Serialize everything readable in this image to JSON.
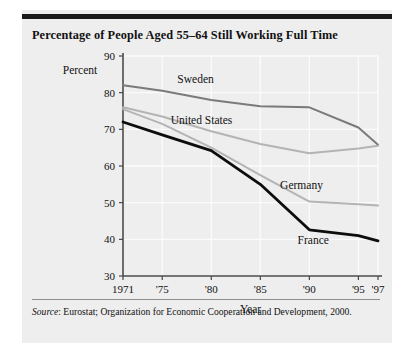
{
  "figure": {
    "title": "Percentage of People Aged 55–64 Still Working Full Time",
    "source_prefix": "Source",
    "source_text": ": Eurostat; Organization for Economic Cooperation and Development, 2000."
  },
  "chart_data": {
    "type": "line",
    "title": "Percentage of People Aged 55–64 Still Working Full Time",
    "xlabel": "Year",
    "ylabel": "Percent",
    "x": [
      1971,
      1975,
      1980,
      1985,
      1990,
      1995,
      1997
    ],
    "tick_labels": [
      "1971",
      "'75",
      "'80",
      "'85",
      "'90",
      "'95",
      "'97"
    ],
    "ylim": [
      30,
      90
    ],
    "yticks": [
      30,
      40,
      50,
      60,
      70,
      80,
      90
    ],
    "ytick_labels": [
      "30",
      "40",
      "50",
      "60",
      "70",
      "80",
      "90"
    ],
    "grid": true,
    "legend": "inline-labels",
    "series": [
      {
        "name": "Sweden",
        "color": "#7a7a7a",
        "width": 2.0,
        "values": [
          82.0,
          80.5,
          78.0,
          76.3,
          76.0,
          70.5,
          65.8
        ],
        "label_x": 1978.4,
        "label_y": 82.6
      },
      {
        "name": "United States",
        "color": "#b4b4b4",
        "width": 2.0,
        "values": [
          76.0,
          73.5,
          69.5,
          66.0,
          63.5,
          64.8,
          65.5
        ],
        "label_x": 1979.0,
        "label_y": 71.5
      },
      {
        "name": "Germany",
        "color": "#b4b4b4",
        "width": 2.0,
        "values": [
          75.5,
          71.5,
          65.0,
          57.5,
          50.3,
          49.6,
          49.2
        ],
        "label_x": 1989.2,
        "label_y": 53.6
      },
      {
        "name": "France",
        "color": "#0d0d0d",
        "width": 2.8,
        "values": [
          72.0,
          68.5,
          64.2,
          55.0,
          42.6,
          41.0,
          39.6
        ],
        "label_x": 1990.4,
        "label_y": 38.6
      }
    ]
  }
}
